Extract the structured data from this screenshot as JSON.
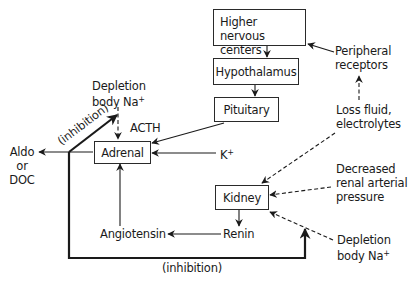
{
  "diagram": {
    "type": "flowchart",
    "title": "",
    "nodes": {
      "higher_nervous_centers": {
        "line1": "Higher nervous",
        "line2": "centers"
      },
      "hypothalamus": "Hypothalamus",
      "pituitary": "Pituitary",
      "adrenal": "Adrenal",
      "kidney": "Kidney"
    },
    "labels": {
      "peripheral_receptors": {
        "line1": "Peripheral",
        "line2": "receptors"
      },
      "loss_fluid": {
        "line1": "Loss fluid,",
        "line2": "electrolytes"
      },
      "decreased_pressure": {
        "line1": "Decreased",
        "line2": "renal arterial",
        "line3": "pressure"
      },
      "depletion_top": {
        "line1": "Depletion",
        "line2": "body Na",
        "sup": "+"
      },
      "depletion_bottom": {
        "line1": "Depletion",
        "line2": "body Na",
        "sup": "+"
      },
      "acth": "ACTH",
      "k_plus": {
        "base": "K",
        "sup": "+"
      },
      "aldo": {
        "line1": "Aldo",
        "line2": "or",
        "line3": "DOC"
      },
      "renin": "Renin",
      "angiotensin": "Angiotensin",
      "inhibition_diag": "(inhibition)",
      "inhibition_bottom": "(inhibition)"
    },
    "edges": [
      {
        "from": "Higher nervous centers",
        "to": "Hypothalamus",
        "style": "solid"
      },
      {
        "from": "Hypothalamus",
        "to": "Pituitary",
        "style": "solid"
      },
      {
        "from": "Pituitary",
        "to": "Adrenal",
        "style": "solid",
        "label": "ACTH"
      },
      {
        "from": "K+",
        "to": "Adrenal",
        "style": "solid"
      },
      {
        "from": "Depletion body Na+ (top)",
        "to": "Adrenal",
        "style": "dashed"
      },
      {
        "from": "Adrenal",
        "to": "Aldo or DOC",
        "style": "solid"
      },
      {
        "from": "Aldo or DOC",
        "to": "Depletion body Na+ (top)",
        "style": "bold",
        "label": "(inhibition)"
      },
      {
        "from": "Angiotensin",
        "to": "Adrenal",
        "style": "solid"
      },
      {
        "from": "Renin",
        "to": "Angiotensin",
        "style": "solid"
      },
      {
        "from": "Kidney",
        "to": "Renin",
        "style": "solid"
      },
      {
        "from": "Peripheral receptors",
        "to": "Higher nervous centers",
        "style": "solid"
      },
      {
        "from": "Loss fluid, electrolytes",
        "to": "Peripheral receptors",
        "style": "dashed"
      },
      {
        "from": "Loss fluid, electrolytes",
        "to": "Kidney",
        "style": "dashed"
      },
      {
        "from": "Decreased renal arterial pressure",
        "to": "Kidney",
        "style": "dashed"
      },
      {
        "from": "Depletion body Na+ (bottom)",
        "to": "Kidney",
        "style": "dashed"
      },
      {
        "from": "Aldo or DOC",
        "to": "Depletion body Na+ (bottom)",
        "style": "bold",
        "label": "(inhibition)"
      }
    ],
    "colors": {
      "ink": "#1a1a1a",
      "background": "#ffffff"
    }
  }
}
